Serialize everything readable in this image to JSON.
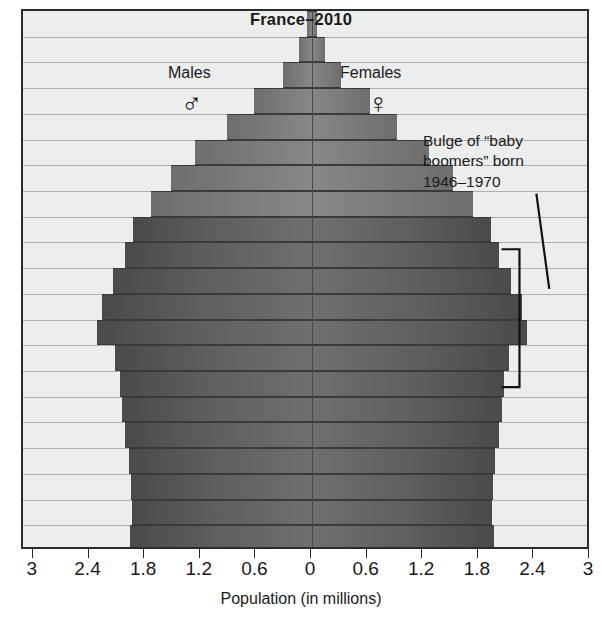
{
  "chart_data": {
    "type": "bar",
    "subtype": "population-pyramid",
    "title": "France–2010",
    "xlabel": "Population (in millions)",
    "ylabel": "",
    "xlim": [
      -3,
      3
    ],
    "x_tick_labels": [
      "3",
      "2.4",
      "1.8",
      "1.2",
      "0.6",
      "0",
      "0.6",
      "1.2",
      "1.8",
      "2.4",
      "3"
    ],
    "x_tick_values": [
      -3,
      -2.4,
      -1.8,
      -1.2,
      -0.6,
      0,
      0.6,
      1.2,
      1.8,
      2.4,
      3
    ],
    "grid": true,
    "legend_position": "inside-top",
    "series": [
      {
        "name": "Males",
        "symbol": "♂",
        "values": [
          0.05,
          0.14,
          0.31,
          0.63,
          0.92,
          1.26,
          1.52,
          1.74,
          1.93,
          2.02,
          2.15,
          2.26,
          2.32,
          2.12,
          2.07,
          2.05,
          2.02,
          1.97,
          1.95,
          1.94,
          1.96
        ]
      },
      {
        "name": "Females",
        "symbol": "♀",
        "values": [
          0.05,
          0.14,
          0.31,
          0.63,
          0.92,
          1.26,
          1.52,
          1.74,
          1.93,
          2.02,
          2.15,
          2.26,
          2.32,
          2.12,
          2.07,
          2.05,
          2.02,
          1.97,
          1.95,
          1.94,
          1.96
        ]
      }
    ],
    "categories": [
      "100+",
      "95–99",
      "90–94",
      "85–89",
      "80–84",
      "75–79",
      "70–74",
      "65–69",
      "60–64",
      "55–59",
      "50–54",
      "45–49",
      "40–44",
      "35–39",
      "30–34",
      "25–29",
      "20–24",
      "15–19",
      "10–14",
      "5–9",
      "0–4"
    ],
    "y_axis_visible_fragments": [
      "0",
      "4",
      "0",
      "4",
      "0",
      "4",
      "0",
      "4",
      "0",
      "4",
      "0",
      "4",
      "0",
      "4",
      "0",
      "4",
      "0",
      "4",
      "0",
      "4",
      "0"
    ],
    "annotations": [
      {
        "id": "baby-boomer-callout",
        "lines": [
          "Bulge of “baby",
          "boomers” born",
          "1946–1970"
        ],
        "bracket_label": "bulge bracket"
      }
    ],
    "colors": {
      "bar_dark": "#4a4a4a",
      "bar_mid": "#5e5e5e",
      "bar_light": "#7b7b7b",
      "plot_background": "#eceded",
      "gridline": "#9a9a9a",
      "axis": "#2b2b2b",
      "text": "#1a1a1a"
    }
  },
  "labels": {
    "males": "Males",
    "females": "Females",
    "male_symbol": "♂",
    "female_symbol": "♀"
  },
  "annotation_text": {
    "line1": "Bulge of “baby",
    "line2": "boomers” born",
    "line3": "1946–1970"
  }
}
